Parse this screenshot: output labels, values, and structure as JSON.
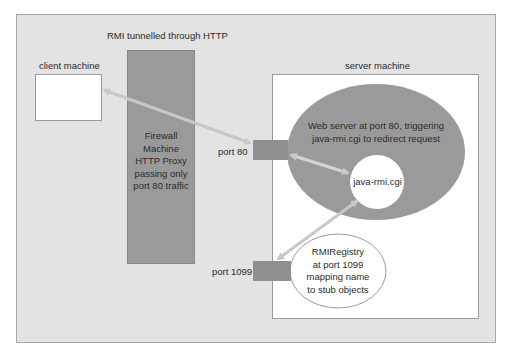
{
  "diagram": {
    "title": "RMI  tunnelled through HTTP",
    "client": {
      "label": "client machine"
    },
    "firewall": {
      "text": "Firewall\nMachine\nHTTP Proxy\npassing only\nport 80 traffic"
    },
    "server": {
      "label": "server machine",
      "web_server": {
        "text": "Web server at port 80, triggering\njava-rmi.cgi to redirect request"
      },
      "cgi": {
        "text": "java-rmi.cgi"
      },
      "registry": {
        "text": "RMIRegistry\nat port 1099\nmapping name\nto stub objects"
      }
    },
    "ports": [
      {
        "label": "port 80"
      },
      {
        "label": "port 1099"
      }
    ],
    "colors": {
      "background": "#e3e3e3",
      "firewall": "#9a9a9a",
      "web_server": "#9a9a9a",
      "port": "#8f8f8f",
      "arrow": "#c8c8c8"
    }
  }
}
